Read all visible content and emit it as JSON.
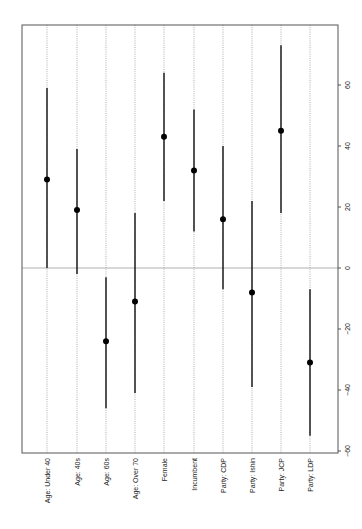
{
  "chart_data": {
    "type": "scatter",
    "subtype": "coefficient-plot-with-intervals",
    "orientation": "rotated-90",
    "title": "",
    "xlabel": "",
    "ylabel": "",
    "categories": [
      "Age: Under 40",
      "Age: 40s",
      "Age: 60s",
      "Age: Over 70",
      "Female",
      "Incumbent",
      "Party: CDP",
      "Party: Ishin",
      "Party: JCP",
      "Party: LDP"
    ],
    "series": [
      {
        "name": "estimate",
        "values": [
          29,
          19,
          -24,
          -11,
          43,
          32,
          16,
          -8,
          45,
          -31
        ]
      },
      {
        "name": "lower",
        "values": [
          0,
          -2,
          -46,
          -41,
          22,
          12,
          -7,
          -39,
          18,
          -55
        ]
      },
      {
        "name": "upper",
        "values": [
          59,
          39,
          -3,
          18,
          64,
          52,
          40,
          22,
          73,
          -7
        ]
      }
    ],
    "value_ticks": [
      60,
      40,
      20,
      0,
      -20,
      -40,
      -60
    ],
    "value_range": [
      -60,
      75
    ],
    "reference_line": 0,
    "grid": "dotted lines at each category",
    "legend": "none"
  },
  "layout": {
    "frame": {
      "left": 22,
      "top": 25,
      "right": 338,
      "bottom": 453
    },
    "zero_y": 268,
    "px_per_unit": 3.05,
    "category_x": [
      47,
      77,
      106,
      135,
      164,
      194,
      223,
      252,
      281,
      310
    ]
  },
  "colors": {
    "point": "#000000",
    "whisker": "#111111",
    "zero_line": "#b0b0b0",
    "grid": "#9a9a9a",
    "frame": "#555555"
  }
}
